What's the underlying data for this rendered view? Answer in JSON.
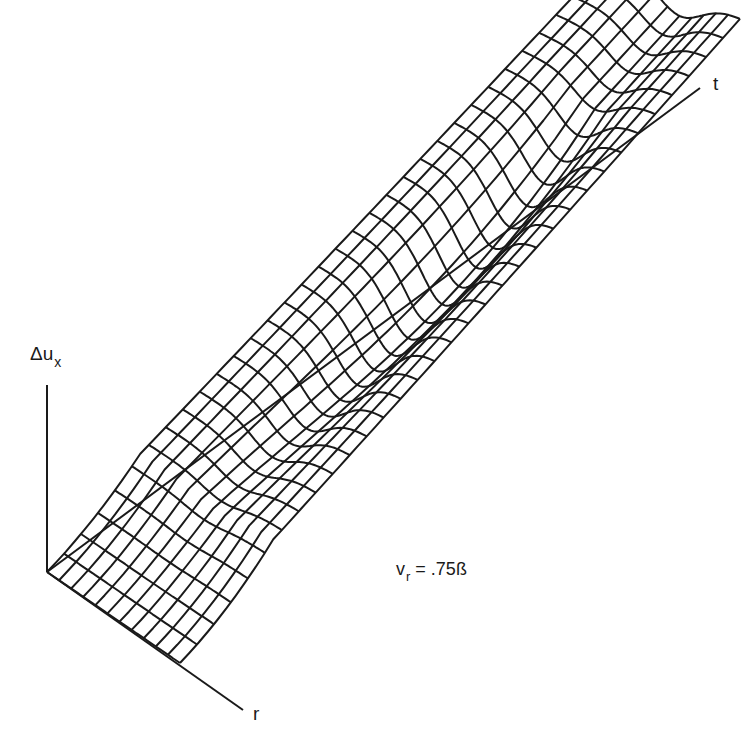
{
  "chart_data": {
    "type": "surface-wireframe",
    "title": "",
    "axes": {
      "vertical": "Δu",
      "vertical_subscript": "x",
      "depth": "t",
      "horizontal": "r"
    },
    "annotation": {
      "text_main": "v",
      "text_sub": "r",
      "text_rest": " = .75ß"
    },
    "mesh": {
      "r_lines": 12,
      "t_lines": 34
    },
    "line_color": "#1a1a1a"
  }
}
